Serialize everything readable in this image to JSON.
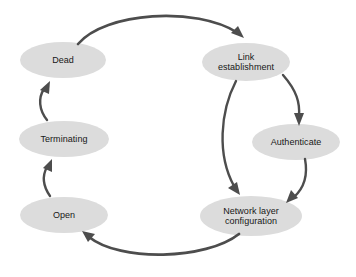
{
  "diagram": {
    "background_color": "#ffffff",
    "node_fill_color": "#dcdcdc",
    "node_text_color": "#171717",
    "edge_color": "#4d4d4d",
    "nodes": [
      {
        "id": "dead",
        "label": "Dead",
        "cx": 63,
        "cy": 60,
        "rx": 43,
        "ry": 18
      },
      {
        "id": "link-establishment",
        "label": "Link\nestablishment",
        "cx": 246,
        "cy": 62,
        "rx": 44,
        "ry": 19
      },
      {
        "id": "authenticate",
        "label": "Authenticate",
        "cx": 296,
        "cy": 142,
        "rx": 44,
        "ry": 18
      },
      {
        "id": "network-layer-configuration",
        "label": "Network layer\nconfiguration",
        "cx": 251,
        "cy": 216,
        "rx": 51,
        "ry": 20
      },
      {
        "id": "open",
        "label": "Open",
        "cx": 64,
        "cy": 215,
        "rx": 44,
        "ry": 18
      },
      {
        "id": "terminating",
        "label": "Terminating",
        "cx": 64,
        "cy": 139,
        "rx": 45,
        "ry": 18
      }
    ],
    "edges": [
      {
        "id": "dead-to-link-establishment",
        "from": "dead",
        "to": "link-establishment",
        "label": ""
      },
      {
        "id": "link-establishment-to-authenticate",
        "from": "link-establishment",
        "to": "authenticate",
        "label": ""
      },
      {
        "id": "link-establishment-to-network-layer-configuration",
        "from": "link-establishment",
        "to": "network-layer-configuration",
        "label": ""
      },
      {
        "id": "authenticate-to-network-layer-configuration",
        "from": "authenticate",
        "to": "network-layer-configuration",
        "label": ""
      },
      {
        "id": "network-layer-configuration-to-open",
        "from": "network-layer-configuration",
        "to": "open",
        "label": ""
      },
      {
        "id": "open-to-terminating",
        "from": "open",
        "to": "terminating",
        "label": ""
      },
      {
        "id": "terminating-to-dead",
        "from": "terminating",
        "to": "dead",
        "label": ""
      }
    ]
  }
}
